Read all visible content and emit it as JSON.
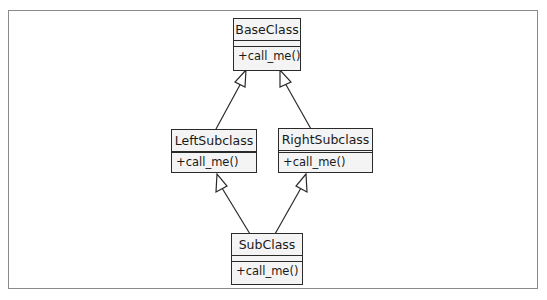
{
  "diagram": {
    "type": "uml-class-diagram",
    "classes": [
      {
        "id": "base",
        "name": "BaseClass",
        "attributes": [],
        "operations": [
          "+call_me()"
        ]
      },
      {
        "id": "left",
        "name": "LeftSubclass",
        "attributes": [],
        "operations": [
          "+call_me()"
        ]
      },
      {
        "id": "right",
        "name": "RightSubclass",
        "attributes": [],
        "operations": [
          "+call_me()"
        ]
      },
      {
        "id": "sub",
        "name": "SubClass",
        "attributes": [],
        "operations": [
          "+call_me()"
        ]
      }
    ],
    "relations": [
      {
        "type": "generalization",
        "from": "LeftSubclass",
        "to": "BaseClass"
      },
      {
        "type": "generalization",
        "from": "RightSubclass",
        "to": "BaseClass"
      },
      {
        "type": "generalization",
        "from": "SubClass",
        "to": "LeftSubclass"
      },
      {
        "type": "generalization",
        "from": "SubClass",
        "to": "RightSubclass"
      }
    ]
  },
  "colors": {
    "line": "#2a2a2a",
    "box_fill": "#f4f4f4",
    "frame": "#8a8a8a"
  }
}
